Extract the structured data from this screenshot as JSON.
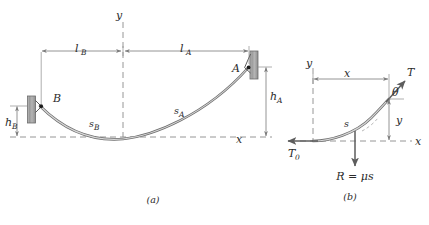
{
  "figure": {
    "panels": [
      {
        "id": "panel-a",
        "caption": "(a)",
        "axis_labels": {
          "x": "x",
          "y": "y"
        },
        "points": [
          {
            "name": "A",
            "label": "A"
          },
          {
            "name": "B",
            "label": "B"
          }
        ],
        "dimensions": [
          {
            "name": "l-b",
            "label": "l",
            "sub": "B",
            "orientation": "horizontal"
          },
          {
            "name": "l-a",
            "label": "l",
            "sub": "A",
            "orientation": "horizontal"
          },
          {
            "name": "h-a",
            "label": "h",
            "sub": "A",
            "orientation": "vertical"
          },
          {
            "name": "h-b",
            "label": "h",
            "sub": "B",
            "orientation": "vertical"
          }
        ],
        "arc_labels": [
          {
            "name": "s-a",
            "label": "s",
            "sub": "A"
          },
          {
            "name": "s-b",
            "label": "s",
            "sub": "B"
          }
        ]
      },
      {
        "id": "panel-b",
        "caption": "(b)",
        "axis_labels": {
          "x": "x",
          "y": "y"
        },
        "dimensions": [
          {
            "name": "x-dim",
            "label": "x",
            "orientation": "horizontal"
          },
          {
            "name": "y-dim",
            "label": "y",
            "orientation": "vertical"
          }
        ],
        "forces": [
          {
            "name": "tension-t",
            "label": "T",
            "direction": "up-right"
          },
          {
            "name": "tension-t0",
            "label": "T",
            "sub": "0",
            "direction": "left"
          },
          {
            "name": "resultant-load",
            "label": "R = μs",
            "direction": "down"
          }
        ],
        "angle": {
          "name": "theta",
          "label": "θ"
        },
        "arc_labels": [
          {
            "name": "s-arc",
            "label": "s"
          }
        ]
      }
    ],
    "colors": {
      "cable": "#6e6e6e",
      "cable_highlight": "#d8d8d8",
      "dimension_line": "#7a7a7a",
      "axis_dash": "#8a8a8a",
      "text": "#2b2b2b",
      "node": "#1a1a1a",
      "wall": "#9b9b9b"
    }
  }
}
